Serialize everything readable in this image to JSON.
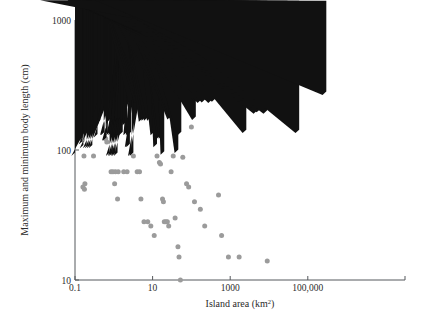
{
  "chart_data": {
    "type": "scatter",
    "title": "",
    "xlabel": "Island area (km2)",
    "xlabel_main": "Island area (km",
    "xlabel_sup": "2",
    "xlabel_tail": ")",
    "ylabel": "Maximum and minimum body length (cm)",
    "xscale": "log",
    "yscale": "log",
    "xlim": [
      0.1,
      10000000
    ],
    "ylim": [
      10,
      1000
    ],
    "xticks": [
      0.1,
      10,
      1000,
      100000
    ],
    "xticklabels": [
      "0.1",
      "10",
      "1000",
      "100,000"
    ],
    "yticks": [
      10,
      100,
      1000
    ],
    "yticklabels": [
      "10",
      "100",
      "1000"
    ],
    "grid": false,
    "legend": "none",
    "series": [
      {
        "name": "Maximum body length",
        "marker": "triangle",
        "color": "#111111",
        "points": [
          [
            0.1,
            90
          ],
          [
            0.155,
            110
          ],
          [
            0.16,
            118
          ],
          [
            0.165,
            103
          ],
          [
            0.2,
            103
          ],
          [
            0.225,
            103
          ],
          [
            0.25,
            103
          ],
          [
            0.28,
            103
          ],
          [
            0.3,
            150
          ],
          [
            0.38,
            125
          ],
          [
            0.45,
            160
          ],
          [
            0.55,
            130
          ],
          [
            0.58,
            130
          ],
          [
            0.62,
            118
          ],
          [
            0.65,
            118
          ],
          [
            0.7,
            130
          ],
          [
            0.78,
            90
          ],
          [
            0.88,
            90
          ],
          [
            0.95,
            90
          ],
          [
            1.05,
            90
          ],
          [
            1.12,
            90
          ],
          [
            1.25,
            90
          ],
          [
            0.8,
            130
          ],
          [
            0.9,
            130
          ],
          [
            1.0,
            130
          ],
          [
            1.1,
            130
          ],
          [
            1.2,
            130
          ],
          [
            1.35,
            130
          ],
          [
            1.5,
            130
          ],
          [
            1.7,
            130
          ],
          [
            0.85,
            165
          ],
          [
            1.05,
            165
          ],
          [
            1.3,
            168
          ],
          [
            1.55,
            170
          ],
          [
            1.9,
            168
          ],
          [
            2.1,
            155
          ],
          [
            2.4,
            105
          ],
          [
            2.6,
            105
          ],
          [
            2.9,
            90
          ],
          [
            3.2,
            90
          ],
          [
            2.2,
            130
          ],
          [
            2.55,
            130
          ],
          [
            2.8,
            130
          ],
          [
            3.0,
            230
          ],
          [
            4.2,
            230
          ],
          [
            5.0,
            225
          ],
          [
            6.0,
            228
          ],
          [
            6.8,
            222
          ],
          [
            8.0,
            230
          ],
          [
            5.5,
            165
          ],
          [
            6.5,
            168
          ],
          [
            7.5,
            168
          ],
          [
            9.0,
            168
          ],
          [
            11,
            130
          ],
          [
            13,
            105
          ],
          [
            16,
            122
          ],
          [
            18,
            122
          ],
          [
            20,
            92
          ],
          [
            22,
            230
          ],
          [
            26,
            228
          ],
          [
            30,
            172
          ],
          [
            34,
            175
          ],
          [
            40,
            160
          ],
          [
            46,
            95
          ],
          [
            55,
            130
          ],
          [
            70,
            235
          ],
          [
            90,
            232
          ],
          [
            110,
            240
          ],
          [
            130,
            170
          ],
          [
            150,
            235
          ],
          [
            180,
            230
          ],
          [
            200,
            240
          ],
          [
            230,
            232
          ],
          [
            260,
            275
          ],
          [
            300,
            430
          ],
          [
            340,
            230
          ],
          [
            420,
            235
          ],
          [
            500,
            430
          ],
          [
            560,
            432
          ],
          [
            700,
            430
          ],
          [
            800,
            240
          ],
          [
            1000,
            230
          ],
          [
            1300,
            200
          ],
          [
            2000,
            215
          ],
          [
            2600,
            135
          ],
          [
            3000,
            700
          ],
          [
            5000,
            190
          ],
          [
            6000,
            195
          ],
          [
            9000,
            190
          ],
          [
            30000,
            230
          ],
          [
            60000,
            135
          ],
          [
            300000,
            265
          ]
        ]
      },
      {
        "name": "Minimum body length",
        "marker": "circle",
        "color": "#9b9b9b",
        "points": [
          [
            0.155,
            120
          ],
          [
            0.17,
            90
          ],
          [
            0.3,
            90
          ],
          [
            0.16,
            52
          ],
          [
            0.175,
            50
          ],
          [
            0.18,
            55
          ],
          [
            0.62,
            122
          ],
          [
            0.66,
            115
          ],
          [
            0.85,
            68
          ],
          [
            0.95,
            68
          ],
          [
            1.1,
            68
          ],
          [
            1.3,
            68
          ],
          [
            1.05,
            55
          ],
          [
            1.25,
            42
          ],
          [
            1.8,
            68
          ],
          [
            2.2,
            68
          ],
          [
            3.2,
            90
          ],
          [
            4.0,
            68
          ],
          [
            4.6,
            68
          ],
          [
            5.0,
            42
          ],
          [
            6.0,
            28
          ],
          [
            7.5,
            28
          ],
          [
            9.0,
            26
          ],
          [
            11,
            22
          ],
          [
            13,
            90
          ],
          [
            15,
            80
          ],
          [
            16,
            78
          ],
          [
            18,
            42
          ],
          [
            19,
            40
          ],
          [
            20,
            28
          ],
          [
            22,
            28
          ],
          [
            24,
            28
          ],
          [
            26,
            26
          ],
          [
            30,
            68
          ],
          [
            34,
            90
          ],
          [
            38,
            30
          ],
          [
            45,
            18
          ],
          [
            48,
            15
          ],
          [
            52,
            10
          ],
          [
            60,
            88
          ],
          [
            75,
            55
          ],
          [
            85,
            52
          ],
          [
            100,
            150
          ],
          [
            120,
            40
          ],
          [
            170,
            35
          ],
          [
            220,
            26
          ],
          [
            500,
            45
          ],
          [
            600,
            22
          ],
          [
            900,
            15
          ],
          [
            1700,
            15
          ],
          [
            9000,
            14
          ]
        ]
      }
    ]
  },
  "axes_geometry": {
    "left_px": 75,
    "right_px": 405,
    "top_px": 20,
    "bottom_px": 280,
    "px_per_decade_x": 38.8,
    "px_per_decade_y": 130
  }
}
